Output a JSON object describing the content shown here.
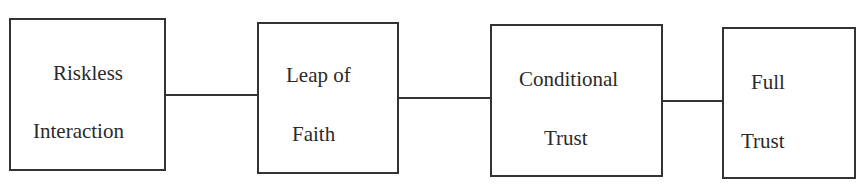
{
  "diagram": {
    "type": "linear-process",
    "colors": {
      "stroke": "#333333",
      "text": "#2a2a2a",
      "background": "#ffffff"
    },
    "nodes": [
      {
        "id": "riskless-interaction",
        "line1": "Riskless",
        "line2": "Interaction"
      },
      {
        "id": "leap-of-faith",
        "line1": "Leap of",
        "line2": "Faith"
      },
      {
        "id": "conditional-trust",
        "line1": "Conditional",
        "line2": "Trust"
      },
      {
        "id": "full-trust",
        "line1": "Full",
        "line2": "Trust"
      }
    ],
    "edges": [
      {
        "from": "riskless-interaction",
        "to": "leap-of-faith"
      },
      {
        "from": "leap-of-faith",
        "to": "conditional-trust"
      },
      {
        "from": "conditional-trust",
        "to": "full-trust"
      }
    ]
  }
}
